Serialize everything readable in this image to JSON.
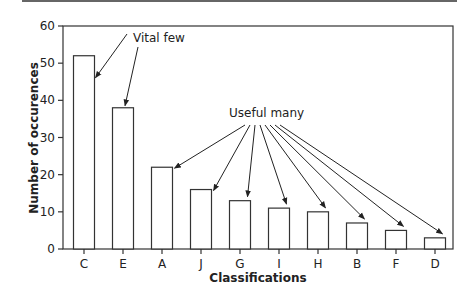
{
  "chart_data": {
    "type": "bar",
    "title": "",
    "xlabel": "Classifications",
    "ylabel": "Number of occurences",
    "categories": [
      "C",
      "E",
      "A",
      "J",
      "G",
      "I",
      "H",
      "B",
      "F",
      "D"
    ],
    "values": [
      52,
      38,
      22,
      16,
      13,
      11,
      10,
      7,
      5,
      3
    ],
    "ylim": [
      0,
      60
    ],
    "yticks": [
      0,
      10,
      20,
      30,
      40,
      50,
      60
    ],
    "grid": false,
    "legend": null,
    "annotations": [
      {
        "text": "Vital few",
        "points_to": [
          "C",
          "E"
        ]
      },
      {
        "text": "Useful many",
        "points_to": [
          "A",
          "J",
          "G",
          "I",
          "H",
          "B",
          "F",
          "D"
        ]
      }
    ]
  }
}
